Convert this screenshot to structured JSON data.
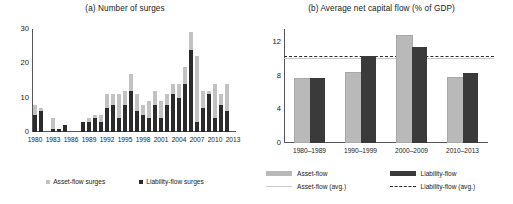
{
  "figure": {
    "background": "#ffffff",
    "colors": {
      "asset_flow": "#c2c2c2",
      "liability_flow": "#2b2b2b",
      "asset_flow_avg_line": "#c9c9c9",
      "liability_flow_avg_line": "#2b2b2b",
      "axis": "#555555"
    }
  },
  "chart_data": [
    {
      "id": "panel-a",
      "type": "bar",
      "subtype": "stacked",
      "title": "(a) Number of surges",
      "xlabel": "",
      "ylabel": "",
      "ylim": [
        0,
        30
      ],
      "yticks": [
        0,
        10,
        20,
        30
      ],
      "ytick_labels": [
        "0",
        "10",
        "20",
        "30"
      ],
      "grid": false,
      "legend_position": "bottom",
      "categories": [
        "1980",
        "1981",
        "1982",
        "1983",
        "1984",
        "1985",
        "1986",
        "1987",
        "1988",
        "1989",
        "1990",
        "1991",
        "1992",
        "1993",
        "1994",
        "1995",
        "1996",
        "1997",
        "1998",
        "1999",
        "2000",
        "2001",
        "2002",
        "2003",
        "2004",
        "2005",
        "2006",
        "2007",
        "2008",
        "2009",
        "2010",
        "2011",
        "2012",
        "2013"
      ],
      "xtick_labels": [
        "1980",
        "1983",
        "1986",
        "1989",
        "1992",
        "1995",
        "1998",
        "2001",
        "2004",
        "2007",
        "2010",
        "2013"
      ],
      "series": [
        {
          "name": "Liability-flow surges",
          "color": "#2b2b2b",
          "values": [
            5,
            6,
            0,
            1,
            1,
            2,
            0,
            0,
            3,
            3,
            4,
            3,
            7,
            8,
            4,
            8,
            12,
            6,
            5,
            4,
            8,
            4,
            8,
            11,
            10,
            14,
            24,
            3,
            7,
            11,
            4,
            8,
            6,
            0
          ]
        },
        {
          "name": "Asset-flow surges",
          "color": "#c2c2c2",
          "values": [
            3,
            1,
            0,
            3,
            0,
            0,
            0,
            0,
            0,
            1,
            1,
            2,
            4,
            3,
            7,
            4,
            5,
            5,
            3,
            5,
            4,
            5,
            3,
            3,
            4,
            5,
            5,
            19,
            5,
            1,
            10,
            3,
            8,
            0
          ]
        }
      ],
      "totals": [
        8,
        7,
        0,
        4,
        1,
        2,
        0,
        0,
        3,
        3,
        5,
        5,
        11,
        11,
        11,
        12,
        17,
        11,
        8,
        9,
        12,
        9,
        11,
        14,
        14,
        19,
        29,
        22,
        12,
        12,
        14,
        11,
        14,
        0
      ]
    },
    {
      "id": "panel-b",
      "type": "bar",
      "subtype": "grouped",
      "title": "(b) Average net capital flow (% of GDP)",
      "xlabel": "",
      "ylabel": "",
      "ylim": [
        0,
        13.6
      ],
      "yticks": [
        0,
        4,
        8,
        12
      ],
      "ytick_labels": [
        "0",
        "4",
        "8",
        "12"
      ],
      "grid": false,
      "legend_position": "bottom",
      "categories": [
        "1980–1989",
        "1990–1999",
        "2000–2009",
        "2010–2013"
      ],
      "series": [
        {
          "name": "Asset-flow",
          "color": "#b9b9b9",
          "values": [
            7.5,
            8.2,
            12.6,
            7.6
          ]
        },
        {
          "name": "Liability-flow",
          "color": "#3a3a3a",
          "values": [
            7.8,
            10.4,
            11.5,
            8.4
          ]
        }
      ],
      "reference_lines": [
        {
          "name": "Asset-flow (avg.)",
          "value": 10.2,
          "style": "solid",
          "color": "#c9c9c9"
        },
        {
          "name": "Liability-flow (avg.)",
          "value": 10.4,
          "style": "dashed",
          "color": "#2b2b2b"
        }
      ]
    }
  ],
  "panel_a": {
    "title": "(a) Number of surges",
    "legend": [
      {
        "label": "Asset-flow surges",
        "color": "#c2c2c2",
        "marker": "square"
      },
      {
        "label": "Liability-flow surges",
        "color": "#2b2b2b",
        "marker": "square"
      }
    ]
  },
  "panel_b": {
    "title": "(b) Average net capital flow (% of GDP)",
    "legend": [
      {
        "label": "Asset-flow",
        "color": "#b9b9b9",
        "marker": "bar"
      },
      {
        "label": "Liability-flow",
        "color": "#3a3a3a",
        "marker": "bar"
      },
      {
        "label": "Asset-flow (avg.)",
        "color": "#c9c9c9",
        "marker": "solid-line"
      },
      {
        "label": "Liability-flow (avg.)",
        "color": "#2b2b2b",
        "marker": "dashed-line"
      }
    ]
  }
}
